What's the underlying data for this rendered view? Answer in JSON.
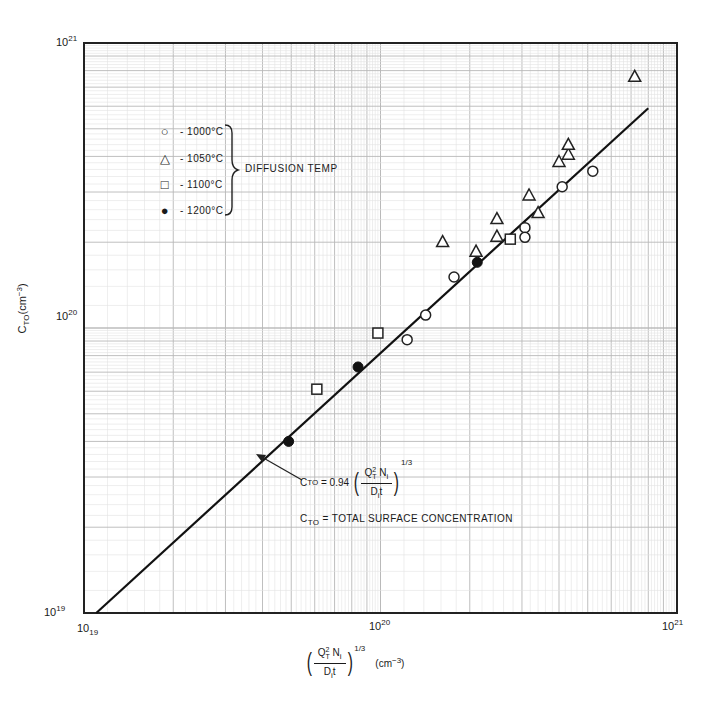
{
  "chart_data": {
    "type": "scatter",
    "title": "",
    "xlabel": "(Q_T^2 N_i / D_i t)^(1/3) (cm^-3)",
    "ylabel": "C_TO (cm^-3)",
    "xscale": "log",
    "yscale": "log",
    "xlim": [
      1e+19,
      1e+21
    ],
    "ylim": [
      1e+19,
      1e+21
    ],
    "x_tick_labels": [
      "10^19",
      "10^20",
      "10^21"
    ],
    "y_tick_labels": [
      "10^19",
      "10^20",
      "10^21"
    ],
    "grid": true,
    "legend_title": "DIFFUSION TEMP",
    "legend_position": "upper-left",
    "series": [
      {
        "name": "1000°C",
        "marker": "open-circle",
        "points": [
          [
            1.23e+20,
            9.1e+19
          ],
          [
            1.42e+20,
            1.11e+20
          ],
          [
            1.77e+20,
            1.51e+20
          ],
          [
            3.07e+20,
            2.25e+20
          ],
          [
            3.07e+20,
            2.08e+20
          ],
          [
            4.1e+20,
            3.13e+20
          ],
          [
            5.2e+20,
            3.55e+20
          ]
        ]
      },
      {
        "name": "1050°C",
        "marker": "open-triangle",
        "points": [
          [
            1.62e+20,
            2.01e+20
          ],
          [
            2.1e+20,
            1.86e+20
          ],
          [
            2.47e+20,
            2.42e+20
          ],
          [
            2.47e+20,
            2.1e+20
          ],
          [
            3.17e+20,
            2.93e+20
          ],
          [
            3.4e+20,
            2.54e+20
          ],
          [
            4e+20,
            3.84e+20
          ],
          [
            4.3e+20,
            4.07e+20
          ],
          [
            4.3e+20,
            4.41e+20
          ],
          [
            7.2e+20,
            7.64e+20
          ]
        ]
      },
      {
        "name": "1100°C",
        "marker": "open-square",
        "points": [
          [
            6.1e+19,
            6.1e+19
          ],
          [
            9.8e+19,
            9.6e+19
          ],
          [
            2.74e+20,
            2.05e+20
          ]
        ]
      },
      {
        "name": "1200°C",
        "marker": "filled-circle",
        "points": [
          [
            4.9e+19,
            4e+19
          ],
          [
            8.4e+19,
            7.3e+19
          ],
          [
            2.12e+20,
            1.7e+20
          ]
        ]
      }
    ],
    "fit_line": {
      "equation": "C_TO = 0.94 (Q_T^2 N_i / D_i t)^(1/3)",
      "coefficient": 0.94,
      "exponent": "1/3",
      "x_range": [
        1.1e+19,
        8e+20
      ],
      "y_range": [
        1e+19,
        5.9e+20
      ]
    },
    "annotations": [
      "C_TO = 0.94 (Q_T^2 N_i / D_i t)^(1/3)",
      "C_TO = TOTAL SURFACE CONCENTRATION"
    ]
  },
  "axes": {
    "y_top": {
      "base": "10",
      "exp": "21"
    },
    "y_mid": {
      "base": "10",
      "exp": "20"
    },
    "y_bot": {
      "base": "10",
      "exp": "19"
    },
    "x_left": {
      "base": "10",
      "exp": "19"
    },
    "x_mid": {
      "base": "10",
      "exp": "20"
    },
    "x_right": {
      "base": "10",
      "exp": "21"
    },
    "ylabel": {
      "main": "C",
      "sub": "TO",
      "unit_open": "(cm",
      "unit_exp": "−3",
      "unit_close": ")"
    },
    "xlabel": {
      "q": "Q",
      "q_sup": "2",
      "q_sub": "T",
      "n": " N",
      "n_sub": "i",
      "d": "D",
      "d_sub": "i",
      "t": "t",
      "power": "1/3",
      "unit_open": "(cm",
      "unit_exp": "−3",
      "unit_close": ")"
    }
  },
  "legend": {
    "items": [
      {
        "symbol": "○",
        "label": "- 1000°C"
      },
      {
        "symbol": "△",
        "label": "- 1050°C"
      },
      {
        "symbol": "□",
        "label": "- 1100°C"
      },
      {
        "symbol": "●",
        "label": "- 1200°C"
      }
    ],
    "group_label": "DIFFUSION TEMP"
  },
  "equation": {
    "lhs_main": "C",
    "lhs_sub": "TO",
    "eq": " = 0.94 ",
    "q": "Q",
    "q_sup": "2",
    "q_sub": "T",
    "n": " N",
    "n_sub": "i",
    "d": "D",
    "d_sub": "i",
    "t": "t",
    "power": "1/3"
  },
  "definition": {
    "main": "C",
    "sub": "TO",
    "text": " = TOTAL SURFACE CONCENTRATION"
  }
}
